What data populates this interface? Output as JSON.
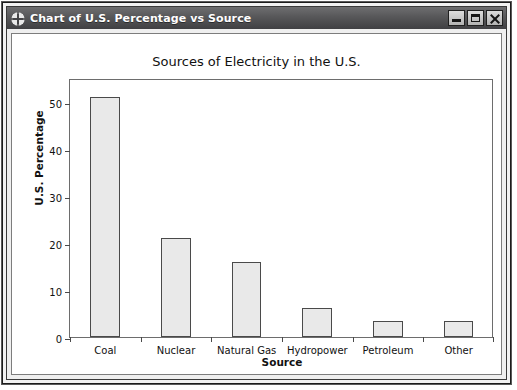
{
  "window": {
    "title": "Chart of U.S. Percentage vs Source",
    "icon": "chart-app-icon",
    "buttons": {
      "minimize": "Minimize",
      "maximize": "Maximize",
      "close": "Close"
    }
  },
  "chart_data": {
    "type": "bar",
    "title": "Sources of Electricity in the U.S.",
    "xlabel": "Source",
    "ylabel": "U.S. Percentage",
    "categories": [
      "Coal",
      "Nuclear",
      "Natural Gas",
      "Hydropower",
      "Petroleum",
      "Other"
    ],
    "values": [
      51,
      21,
      16,
      6.2,
      3.4,
      3.3
    ],
    "ylim": [
      0,
      55
    ],
    "yticks": [
      0,
      10,
      20,
      30,
      40,
      50
    ],
    "ytick_labels": [
      "0",
      "10",
      "20",
      "30",
      "40",
      "50"
    ],
    "grid": false,
    "legend": null,
    "bar_fill": "#e9e9e9",
    "bar_edge": "#4a4a4a"
  }
}
